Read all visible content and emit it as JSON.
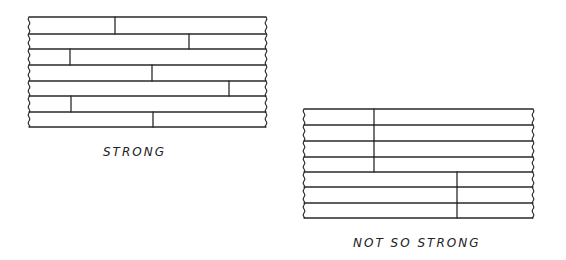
{
  "diagrams": [
    {
      "id": "strong",
      "caption": "STRONG",
      "caption_pos": {
        "x": 103,
        "y": 145
      },
      "left": 29,
      "right": 266,
      "rows_y": [
        17,
        34,
        49,
        65,
        81,
        96,
        112,
        127
      ],
      "joints": [
        {
          "row": 0,
          "x": 115
        },
        {
          "row": 1,
          "x": 189
        },
        {
          "row": 2,
          "x": 70
        },
        {
          "row": 3,
          "x": 152
        },
        {
          "row": 4,
          "x": 229
        },
        {
          "row": 5,
          "x": 71
        },
        {
          "row": 6,
          "x": 153
        }
      ]
    },
    {
      "id": "not-so-strong",
      "caption": "NOT SO STRONG",
      "caption_pos": {
        "x": 353,
        "y": 236
      },
      "left": 304,
      "right": 533,
      "rows_y": [
        109,
        125,
        141,
        157,
        172,
        187,
        203,
        218
      ],
      "joints": [
        {
          "row": 0,
          "x": 374
        },
        {
          "row": 1,
          "x": 374
        },
        {
          "row": 2,
          "x": 374
        },
        {
          "row": 3,
          "x": 374
        },
        {
          "row": 4,
          "x": 457
        },
        {
          "row": 5,
          "x": 457
        },
        {
          "row": 6,
          "x": 457
        }
      ]
    }
  ],
  "colors": {
    "ink": "#2a2a2a",
    "background": "#ffffff"
  }
}
